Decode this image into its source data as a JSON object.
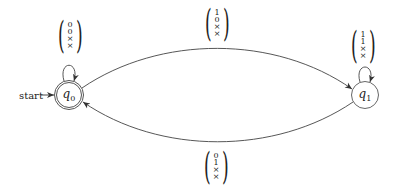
{
  "diagram": {
    "type": "finite-automaton",
    "start_label": "start",
    "states": [
      {
        "id": "q0",
        "name": "q",
        "sub": "0",
        "accepting": true,
        "initial": true
      },
      {
        "id": "q1",
        "name": "q",
        "sub": "1",
        "accepting": false,
        "initial": false
      }
    ],
    "transitions": [
      {
        "from": "q0",
        "to": "q0",
        "label": [
          "0",
          "0",
          "×",
          "×"
        ]
      },
      {
        "from": "q0",
        "to": "q1",
        "label": [
          "1",
          "0",
          "×",
          "×"
        ]
      },
      {
        "from": "q1",
        "to": "q1",
        "label": [
          "1",
          "1",
          "×",
          "×"
        ]
      },
      {
        "from": "q1",
        "to": "q0",
        "label": [
          "0",
          "1",
          "×",
          "×"
        ]
      }
    ]
  }
}
